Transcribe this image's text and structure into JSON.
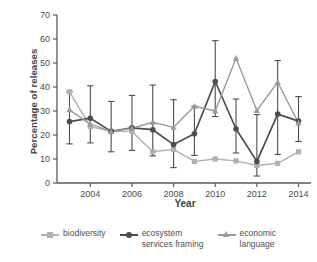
{
  "chart_data": {
    "type": "line",
    "title": "",
    "xlabel": "Year",
    "ylabel": "Percentage of releases",
    "xlim": [
      2002.4,
      2014.6
    ],
    "ylim": [
      0,
      70
    ],
    "ytick_labels": [
      "0",
      "10",
      "20",
      "30",
      "40",
      "50",
      "60",
      "70"
    ],
    "ytick_values": [
      0,
      10,
      20,
      30,
      40,
      50,
      60,
      70
    ],
    "xtick_labels": [
      "2004",
      "2006",
      "2008",
      "2010",
      "2012",
      "2014"
    ],
    "xtick_values": [
      2004,
      2006,
      2008,
      2010,
      2012,
      2014
    ],
    "grid": false,
    "legend_position": "below",
    "x": [
      2003,
      2004,
      2005,
      2006,
      2007,
      2008,
      2009,
      2010,
      2011,
      2012,
      2013,
      2014
    ],
    "series": [
      {
        "name": "biodiversity",
        "marker": "square",
        "color": "#b0b0b0",
        "values": [
          38.0,
          23.5,
          21.5,
          21.5,
          13.0,
          14.0,
          9.0,
          10.0,
          9.2,
          7.3,
          8.2,
          13.0
        ],
        "err_low": [
          38.0,
          23.5,
          21.5,
          21.5,
          13.0,
          14.0,
          9.0,
          10.0,
          9.2,
          7.3,
          8.2,
          13.0
        ],
        "err_high": [
          38.0,
          23.5,
          21.5,
          21.5,
          13.0,
          14.0,
          9.0,
          10.0,
          9.2,
          7.3,
          8.2,
          13.0
        ]
      },
      {
        "name": "ecosystem\nservices framing",
        "marker": "circle",
        "color": "#4d4d4d",
        "values": [
          25.6,
          27.0,
          21.5,
          23.0,
          22.2,
          16.0,
          20.5,
          42.3,
          22.5,
          9.0,
          28.7,
          25.8
        ],
        "err_low": [
          16.3,
          16.7,
          13.0,
          13.6,
          11.3,
          6.4,
          11.5,
          27.7,
          12.5,
          2.9,
          11.9,
          17.3
        ],
        "err_high": [
          38.0,
          40.5,
          34.0,
          36.5,
          40.8,
          34.7,
          32.0,
          59.3,
          35.0,
          28.5,
          51.0,
          36.0
        ]
      },
      {
        "name": "economic\nlanguage",
        "marker": "triangle",
        "color": "#9a9a9a",
        "values": [
          30.5,
          24.5,
          21.5,
          22.8,
          25.3,
          23.2,
          32.0,
          30.0,
          52.0,
          30.2,
          42.0,
          25.0
        ],
        "err_low": [
          30.5,
          24.5,
          21.5,
          22.8,
          25.3,
          23.2,
          32.0,
          30.0,
          52.0,
          30.2,
          42.0,
          25.0
        ],
        "err_high": [
          30.5,
          24.5,
          21.5,
          22.8,
          25.3,
          23.2,
          32.0,
          30.0,
          52.0,
          30.2,
          42.0,
          25.0
        ]
      }
    ],
    "colors": {
      "biodiversity": "#b0b0b0",
      "ecosystem_services_framing": "#4d4d4d",
      "economic_language": "#9a9a9a",
      "axis": "#5a5a5a",
      "background": "#ffffff"
    }
  },
  "legend": {
    "items": [
      {
        "label": "biodiversity",
        "marker": "square-marker-icon",
        "color": "#b0b0b0"
      },
      {
        "label": "ecosystem\nservices framing",
        "marker": "circle-marker-icon",
        "color": "#4d4d4d"
      },
      {
        "label": "economic\nlanguage",
        "marker": "triangle-marker-icon",
        "color": "#9a9a9a"
      }
    ]
  },
  "axes": {
    "x_title": "Year",
    "y_title": "Percentage of releases"
  }
}
